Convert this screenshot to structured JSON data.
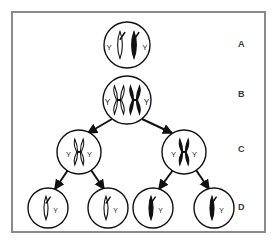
{
  "figure": {
    "border_color": "#8a8a8a",
    "background_color": "#ffffff",
    "stroke_color": "#111111"
  },
  "stage_labels": [
    {
      "id": "A",
      "text": "A",
      "description": "Parent cell before replication"
    },
    {
      "id": "B",
      "text": "B",
      "description": "Cell with replicated chromosomes"
    },
    {
      "id": "C",
      "text": "C",
      "description": "Two cells after first division"
    },
    {
      "id": "D",
      "text": "D",
      "description": "Four cells after second division"
    }
  ],
  "chromosome_label": "Y",
  "rows": [
    {
      "row_id": "A",
      "cells": [
        {
          "cell_id": "A1",
          "cx": 127,
          "cy": 45,
          "r": 23,
          "chromosomes": [
            {
              "shape": "rod",
              "fill": "white",
              "offset_x": -7,
              "label": "Y",
              "label_side": "left"
            },
            {
              "shape": "rod",
              "fill": "black",
              "offset_x": 7,
              "label": "Y",
              "label_side": "right"
            }
          ]
        }
      ]
    },
    {
      "row_id": "B",
      "cells": [
        {
          "cell_id": "B1",
          "cx": 127,
          "cy": 100,
          "r": 24,
          "chromosomes": [
            {
              "shape": "x",
              "fill": "white",
              "offset_x": -8,
              "label": "Y",
              "label_side": "left"
            },
            {
              "shape": "x",
              "fill": "black",
              "offset_x": 8,
              "label": "Y",
              "label_side": "right"
            }
          ]
        }
      ]
    },
    {
      "row_id": "C",
      "cells": [
        {
          "cell_id": "C1",
          "cx": 79,
          "cy": 152,
          "r": 22,
          "chromosomes": [
            {
              "shape": "x",
              "fill": "white",
              "offset_x": 0,
              "label": "Y",
              "label_side": "both"
            }
          ]
        },
        {
          "cell_id": "C2",
          "cx": 184,
          "cy": 152,
          "r": 22,
          "chromosomes": [
            {
              "shape": "x",
              "fill": "black",
              "offset_x": 0,
              "label": "Y",
              "label_side": "both"
            }
          ]
        }
      ]
    },
    {
      "row_id": "D",
      "cells": [
        {
          "cell_id": "D1",
          "cx": 48,
          "cy": 208,
          "r": 20,
          "chromosomes": [
            {
              "shape": "rod",
              "fill": "white",
              "offset_x": -2,
              "label": "Y",
              "label_side": "right"
            }
          ]
        },
        {
          "cell_id": "D2",
          "cx": 108,
          "cy": 208,
          "r": 20,
          "chromosomes": [
            {
              "shape": "rod",
              "fill": "white",
              "offset_x": -2,
              "label": "Y",
              "label_side": "right"
            }
          ]
        },
        {
          "cell_id": "D3",
          "cx": 153,
          "cy": 208,
          "r": 20,
          "chromosomes": [
            {
              "shape": "rod",
              "fill": "black",
              "offset_x": -2,
              "label": "Y",
              "label_side": "right"
            }
          ]
        },
        {
          "cell_id": "D4",
          "cx": 214,
          "cy": 208,
          "r": 20,
          "chromosomes": [
            {
              "shape": "rod",
              "fill": "black",
              "offset_x": -2,
              "label": "Y",
              "label_side": "right"
            }
          ]
        }
      ]
    }
  ],
  "arrows": [
    {
      "arrow_id": "B1-to-C1",
      "from": "B1",
      "to": "C1",
      "x1": 112,
      "y1": 119,
      "x2": 88,
      "y2": 133
    },
    {
      "arrow_id": "B1-to-C2",
      "from": "B1",
      "to": "C2",
      "x1": 142,
      "y1": 119,
      "x2": 172,
      "y2": 133
    },
    {
      "arrow_id": "C1-to-D1",
      "from": "C1",
      "to": "D1",
      "x1": 68,
      "y1": 170,
      "x2": 55,
      "y2": 189
    },
    {
      "arrow_id": "C1-to-D2",
      "from": "C1",
      "to": "D2",
      "x1": 91,
      "y1": 170,
      "x2": 104,
      "y2": 189
    },
    {
      "arrow_id": "C2-to-D3",
      "from": "C2",
      "to": "D3",
      "x1": 173,
      "y1": 170,
      "x2": 159,
      "y2": 189
    },
    {
      "arrow_id": "C2-to-D4",
      "from": "C2",
      "to": "D4",
      "x1": 196,
      "y1": 170,
      "x2": 209,
      "y2": 189
    }
  ]
}
